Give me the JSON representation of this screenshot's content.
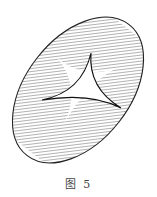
{
  "figure": {
    "caption": "图 5",
    "colors": {
      "stroke": "#222222",
      "hatch": "#555555",
      "background": "#ffffff"
    }
  }
}
